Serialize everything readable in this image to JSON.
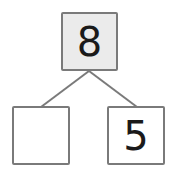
{
  "diagram": {
    "type": "number-bond",
    "whole": {
      "value": "8"
    },
    "parts": [
      {
        "value": ""
      },
      {
        "value": "5"
      }
    ],
    "colors": {
      "border": "#7a7a7a",
      "whole_fill": "#ebebeb",
      "part_fill": "#ffffff",
      "line": "#7a7a7a",
      "text": "#1a1a1a"
    }
  }
}
